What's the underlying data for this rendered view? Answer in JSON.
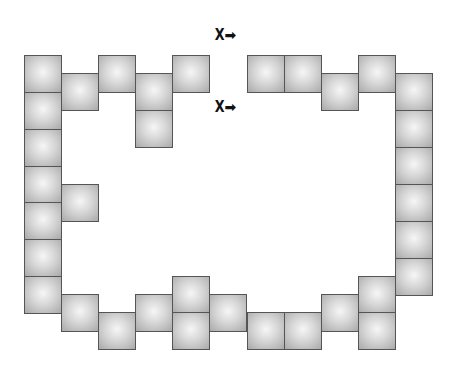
{
  "board": {
    "block_size": 37,
    "block_color": "#c8c8c8",
    "border_color": "#555555",
    "blocks": [
      {
        "x": 24,
        "y": 55
      },
      {
        "x": 24,
        "y": 92
      },
      {
        "x": 24,
        "y": 129
      },
      {
        "x": 24,
        "y": 166
      },
      {
        "x": 24,
        "y": 202
      },
      {
        "x": 24,
        "y": 239
      },
      {
        "x": 24,
        "y": 276
      },
      {
        "x": 61,
        "y": 73
      },
      {
        "x": 61,
        "y": 184
      },
      {
        "x": 61,
        "y": 294
      },
      {
        "x": 98,
        "y": 55
      },
      {
        "x": 98,
        "y": 312
      },
      {
        "x": 135,
        "y": 73
      },
      {
        "x": 135,
        "y": 110
      },
      {
        "x": 135,
        "y": 294
      },
      {
        "x": 172,
        "y": 55
      },
      {
        "x": 172,
        "y": 276
      },
      {
        "x": 172,
        "y": 312
      },
      {
        "x": 209,
        "y": 294
      },
      {
        "x": 247,
        "y": 55
      },
      {
        "x": 247,
        "y": 312
      },
      {
        "x": 284,
        "y": 55
      },
      {
        "x": 284,
        "y": 312
      },
      {
        "x": 321,
        "y": 73
      },
      {
        "x": 321,
        "y": 294
      },
      {
        "x": 358,
        "y": 55
      },
      {
        "x": 358,
        "y": 276
      },
      {
        "x": 358,
        "y": 312
      },
      {
        "x": 395,
        "y": 73
      },
      {
        "x": 395,
        "y": 110
      },
      {
        "x": 395,
        "y": 147
      },
      {
        "x": 395,
        "y": 184
      },
      {
        "x": 395,
        "y": 221
      },
      {
        "x": 395,
        "y": 258
      }
    ]
  },
  "markers": [
    {
      "label": "X",
      "arrow": "➡",
      "x": 214,
      "y": 28
    },
    {
      "label": "X",
      "arrow": "➡",
      "x": 214,
      "y": 100
    }
  ]
}
